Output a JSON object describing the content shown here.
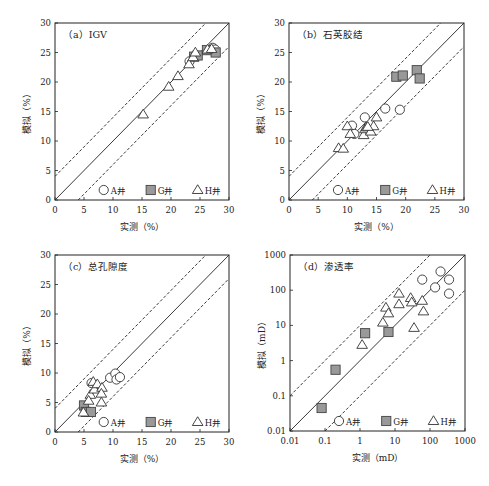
{
  "figure": {
    "width": 489,
    "height": 486,
    "legend": [
      {
        "key": "A",
        "label": "A井",
        "marker": "circle",
        "fill": "#ffffff"
      },
      {
        "key": "G",
        "label": "G井",
        "marker": "square",
        "fill": "#999999"
      },
      {
        "key": "H",
        "label": "H井",
        "marker": "triangle",
        "fill": "#ffffff"
      }
    ]
  },
  "chart_data": [
    {
      "id": "a",
      "type": "scatter",
      "title": "（a）IGV",
      "xlabel": "实测（%）",
      "ylabel": "模拟（%）",
      "scale": "linear",
      "xlim": [
        0,
        30
      ],
      "ylim": [
        0,
        30
      ],
      "xticks": [
        "0",
        "5",
        "10",
        "15",
        "20",
        "25",
        "30"
      ],
      "yticks": [
        "0",
        "5",
        "10",
        "15",
        "20",
        "25",
        "30"
      ],
      "reference_lines": {
        "identity": "y=x",
        "upper": "y=x+4",
        "lower": "y=x-4"
      },
      "frame": {
        "x0": 55,
        "x1": 229,
        "y0": 23,
        "y1": 200
      },
      "series": [
        {
          "name": "A井",
          "key": "A",
          "points": [
            [
              23.2,
              23.5
            ],
            [
              27.2,
              25.8
            ],
            [
              27.6,
              25.5
            ]
          ]
        },
        {
          "name": "G井",
          "key": "G",
          "points": [
            [
              24.0,
              24.3
            ],
            [
              24.6,
              24.5
            ],
            [
              26.2,
              25.4
            ],
            [
              27.7,
              25.0
            ]
          ]
        },
        {
          "name": "H井",
          "key": "H",
          "points": [
            [
              15.2,
              14.5
            ],
            [
              19.6,
              19.2
            ],
            [
              21.2,
              21.0
            ],
            [
              23.1,
              23.0
            ],
            [
              23.8,
              24.2
            ],
            [
              24.2,
              25.0
            ],
            [
              26.3,
              25.5
            ],
            [
              27.0,
              25.6
            ]
          ]
        }
      ]
    },
    {
      "id": "b",
      "type": "scatter",
      "title": "（b）石英胶结",
      "xlabel": "实测（%）",
      "ylabel": "模拟（%）",
      "scale": "linear",
      "xlim": [
        0,
        30
      ],
      "ylim": [
        0,
        30
      ],
      "xticks": [
        "0",
        "5",
        "10",
        "15",
        "20",
        "25",
        "30"
      ],
      "yticks": [
        "0",
        "5",
        "10",
        "15",
        "20",
        "25",
        "30"
      ],
      "reference_lines": {
        "identity": "y=x",
        "upper": "y=x+4",
        "lower": "y=x-4"
      },
      "frame": {
        "x0": 289,
        "x1": 464,
        "y0": 23,
        "y1": 200
      },
      "series": [
        {
          "name": "A井",
          "key": "A",
          "points": [
            [
              10.8,
              12.6
            ],
            [
              13.0,
              14.0
            ],
            [
              16.5,
              15.5
            ],
            [
              19.0,
              15.3
            ],
            [
              11.2,
              11.2
            ]
          ]
        },
        {
          "name": "G井",
          "key": "G",
          "points": [
            [
              18.4,
              20.9
            ],
            [
              19.5,
              21.1
            ],
            [
              21.9,
              22.0
            ],
            [
              22.4,
              20.6
            ]
          ]
        },
        {
          "name": "H井",
          "key": "H",
          "points": [
            [
              8.5,
              8.8
            ],
            [
              9.3,
              8.7
            ],
            [
              10.0,
              12.5
            ],
            [
              10.5,
              11.2
            ],
            [
              12.8,
              11.0
            ],
            [
              13.0,
              12.0
            ],
            [
              13.3,
              12.3
            ],
            [
              14.0,
              11.6
            ],
            [
              14.5,
              12.5
            ],
            [
              15.0,
              14.0
            ],
            [
              13.5,
              12.4
            ]
          ]
        }
      ]
    },
    {
      "id": "c",
      "type": "scatter",
      "title": "（c）总孔隙度",
      "xlabel": "实测（%）",
      "ylabel": "模拟（%）",
      "scale": "linear",
      "xlim": [
        0,
        30
      ],
      "ylim": [
        0,
        30
      ],
      "xticks": [
        "0",
        "5",
        "10",
        "15",
        "20",
        "25",
        "30"
      ],
      "yticks": [
        "0",
        "5",
        "10",
        "15",
        "20",
        "25",
        "30"
      ],
      "reference_lines": {
        "identity": "y=x",
        "upper": "y=x+4",
        "lower": "y=x-4"
      },
      "frame": {
        "x0": 55,
        "x1": 229,
        "y0": 255,
        "y1": 432
      },
      "series": [
        {
          "name": "A井",
          "key": "A",
          "points": [
            [
              9.5,
              9.2
            ],
            [
              10.4,
              9.9
            ],
            [
              10.6,
              8.9
            ],
            [
              11.2,
              9.3
            ],
            [
              6.3,
              8.3
            ]
          ]
        },
        {
          "name": "G井",
          "key": "G",
          "points": [
            [
              5.0,
              4.5
            ],
            [
              5.3,
              3.4
            ],
            [
              6.2,
              3.4
            ]
          ]
        },
        {
          "name": "H井",
          "key": "H",
          "points": [
            [
              4.9,
              3.3
            ],
            [
              6.1,
              6.3
            ],
            [
              6.6,
              8.5
            ],
            [
              6.8,
              7.2
            ],
            [
              7.3,
              8.1
            ],
            [
              8.1,
              7.5
            ],
            [
              8.0,
              6.5
            ],
            [
              8.0,
              5.0
            ],
            [
              5.8,
              5.3
            ]
          ]
        }
      ]
    },
    {
      "id": "d",
      "type": "scatter",
      "title": "（d）渗透率",
      "xlabel": "实测（mD）",
      "ylabel": "模拟（mD）",
      "scale": "log",
      "xlim": [
        0.01,
        1000
      ],
      "ylim": [
        0.01,
        1000
      ],
      "xticks": [
        "0.01",
        "0.1",
        "1",
        "10",
        "100",
        "1000"
      ],
      "yticks": [
        "0.01",
        "0.1",
        "1",
        "10",
        "100",
        "1000"
      ],
      "reference_lines": {
        "identity": "y=x",
        "upper": "y=10x",
        "lower": "y=x/10"
      },
      "frame": {
        "x0": 290,
        "x1": 465,
        "y0": 255,
        "y1": 431
      },
      "series": [
        {
          "name": "A井",
          "key": "A",
          "points": [
            [
              60,
              200
            ],
            [
              200,
              340
            ],
            [
              140,
              120
            ],
            [
              350,
              200
            ],
            [
              350,
              80
            ]
          ]
        },
        {
          "name": "G井",
          "key": "G",
          "points": [
            [
              0.08,
              0.045
            ],
            [
              0.2,
              0.55
            ],
            [
              1.4,
              6
            ],
            [
              6.5,
              6.5
            ]
          ]
        },
        {
          "name": "H井",
          "key": "H",
          "points": [
            [
              1.15,
              2.8
            ],
            [
              4.5,
              12
            ],
            [
              5.5,
              32
            ],
            [
              6.5,
              22
            ],
            [
              13,
              80
            ],
            [
              13,
              40
            ],
            [
              28,
              60
            ],
            [
              30,
              45
            ],
            [
              35,
              8.5
            ],
            [
              60,
              50
            ],
            [
              65,
              25
            ]
          ]
        }
      ]
    }
  ]
}
